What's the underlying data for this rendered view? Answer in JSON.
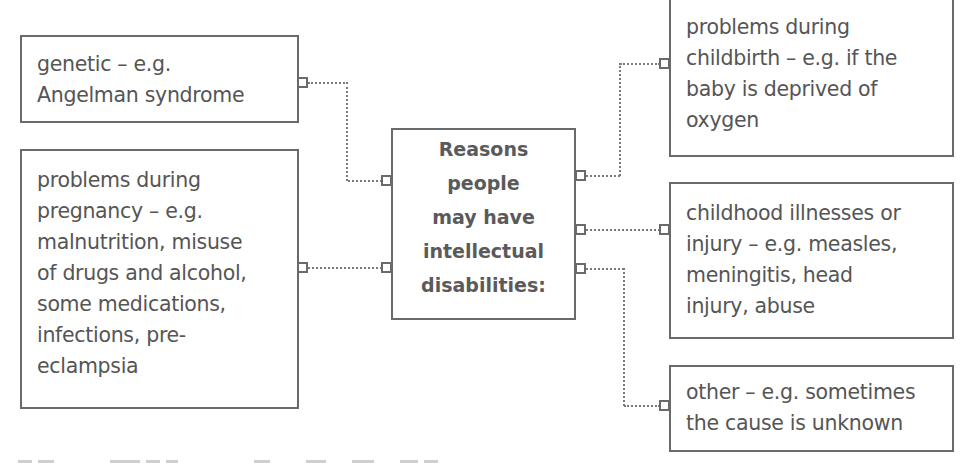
{
  "diagram": {
    "center": {
      "label": "Reasons\npeople\nmay have\nintellectual\ndisabilities:"
    },
    "left_boxes": [
      {
        "id": "genetic",
        "text": "genetic – e.g.\nAngelman syndrome"
      },
      {
        "id": "pregnancy",
        "text": "problems during\npregnancy – e.g.\nmalnutrition, misuse\nof drugs and alcohol,\nsome medications,\ninfections, pre-\neclampsia"
      }
    ],
    "right_boxes": [
      {
        "id": "childbirth",
        "text": "problems during\nchildbirth – e.g. if the\nbaby is deprived of\noxygen"
      },
      {
        "id": "childhood",
        "text": "childhood illnesses or\ninjury – e.g. measles,\nmeningitis, head\ninjury, abuse"
      },
      {
        "id": "other",
        "text": "other – e.g. sometimes\nthe cause is unknown"
      }
    ],
    "connector_style": "dotted",
    "colors": {
      "border": "#6a6a6a",
      "text": "#555555",
      "connector": "#7a7a7a",
      "background": "#ffffff"
    }
  }
}
